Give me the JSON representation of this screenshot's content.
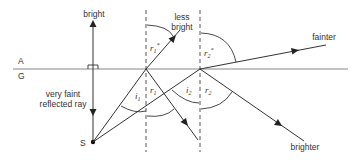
{
  "diagram": {
    "media": {
      "upper": "A",
      "lower": "G"
    },
    "source": {
      "label": "S"
    },
    "rays": {
      "normal_ray_up": "bright",
      "normal_ray_down": "very faint",
      "normal_ray_down_2": "reflected ray",
      "refracted_1_line1": "less",
      "refracted_1_line2": "bright",
      "refracted_2": "fainter",
      "reflected_2": "brighter"
    },
    "angles": {
      "i1": {
        "main": "i",
        "sub": "1"
      },
      "r1": {
        "main": "r",
        "sub": "1"
      },
      "r1_star": {
        "main": "r",
        "sub": "1",
        "sup": "*"
      },
      "i2": {
        "main": "i",
        "sub": "2"
      },
      "r2": {
        "main": "r",
        "sub": "2"
      },
      "r2_star": {
        "main": "r",
        "sub": "2",
        "sup": "*"
      }
    },
    "colors": {
      "line": "#333333",
      "surface": "#777777",
      "background": "#ffffff"
    }
  }
}
